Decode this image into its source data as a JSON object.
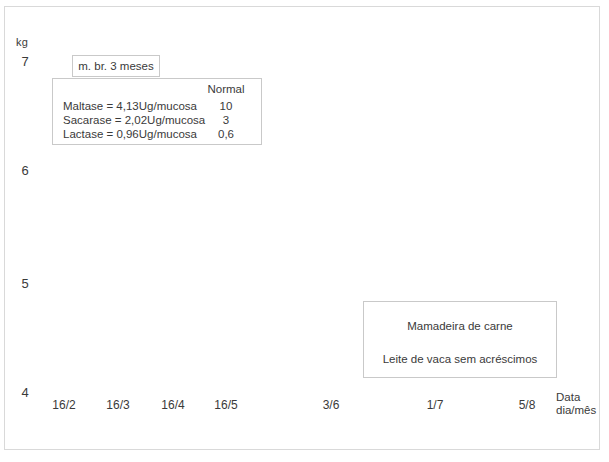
{
  "chart_data": {
    "type": "line",
    "title": "",
    "xlabel": "Data dia/mês",
    "ylabel": "kg",
    "ylim": [
      4,
      7
    ],
    "yticks": [
      "7",
      "6",
      "5",
      "4"
    ],
    "xticks": [
      "16/2",
      "16/3",
      "16/4",
      "16/5",
      "3/6",
      "1/7",
      "5/8"
    ],
    "grid": false,
    "legend": "none",
    "series": [],
    "annotations": [
      "m. br. 3 meses",
      "Mamadeira de carne",
      "Leite de vaca sem acréscimos"
    ]
  },
  "axes": {
    "unit": "kg",
    "y_ticks": [
      "7",
      "6",
      "5",
      "4"
    ],
    "x_ticks": [
      "16/2",
      "16/3",
      "16/4",
      "16/5",
      "3/6",
      "1/7",
      "5/8"
    ],
    "x_title_line1": "Data",
    "x_title_line2": "dia/mês"
  },
  "milk_box": {
    "label": "m. br. 3 meses"
  },
  "enzyme_table": {
    "column_header": "Normal",
    "rows": [
      {
        "label": "Maltase  =  4,13Ug/mucosa",
        "normal": "10"
      },
      {
        "label": "Sacarase  =  2,02Ug/mucosa",
        "normal": "3"
      },
      {
        "label": "Lactase  =  0,96Ug/mucosa",
        "normal": "0,6"
      }
    ]
  },
  "feeding_box": {
    "lines": [
      "Mamadeira de carne",
      "Leite de vaca sem acréscimos"
    ]
  },
  "colors": {
    "frame": "#d9d9d9",
    "box_border": "#c9c9c9",
    "text": "#3a3a3a",
    "background": "#ffffff"
  }
}
